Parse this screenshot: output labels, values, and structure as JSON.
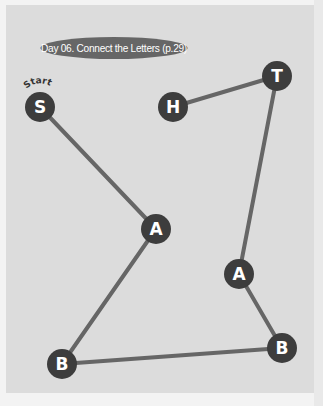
{
  "title": "Day 06. Connect the Letters (p.29)",
  "start_label": "Start",
  "colors": {
    "node_fill": "#3d3d3d",
    "line": "#666666",
    "panel": "#dcdcdc",
    "pill": "#666666"
  },
  "nodes": [
    {
      "id": "S",
      "label": "S",
      "order": 1
    },
    {
      "id": "A1",
      "label": "A",
      "order": 2
    },
    {
      "id": "B1",
      "label": "B",
      "order": 3
    },
    {
      "id": "B2",
      "label": "B",
      "order": 4
    },
    {
      "id": "A2",
      "label": "A",
      "order": 5
    },
    {
      "id": "T",
      "label": "T",
      "order": 6
    },
    {
      "id": "H",
      "label": "H",
      "order": 7
    }
  ],
  "path_order": [
    "S",
    "A1",
    "B1",
    "B2",
    "A2",
    "T",
    "H"
  ],
  "spelled_word": "SABBATH"
}
